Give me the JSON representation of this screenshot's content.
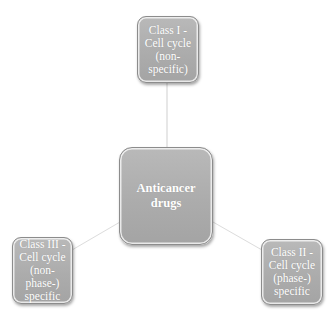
{
  "diagram": {
    "type": "hub-and-spoke",
    "colors": {
      "node_fill": "#adadad",
      "node_border": "#8c8c8c",
      "node_text": "#ffffff",
      "connector": "#d6d6d6",
      "background": "#ffffff"
    },
    "center": {
      "label": "Anticancer\ndrugs"
    },
    "nodes": [
      {
        "id": "class-1",
        "position": "top",
        "label": "Class I -\nCell cycle\n(non-\nspecific)"
      },
      {
        "id": "class-2",
        "position": "bottom-right",
        "label": "Class II -\nCell cycle\n(phase-)\nspecific"
      },
      {
        "id": "class-3",
        "position": "bottom-left",
        "label": "Class III -\nCell cycle\n(non-\nphase-)\nspecific"
      }
    ]
  }
}
